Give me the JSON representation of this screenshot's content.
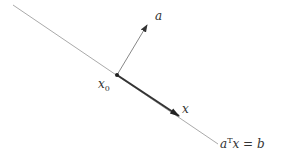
{
  "diagram": {
    "hyperplane": {
      "label_a": "a",
      "label_sup": "T",
      "label_x": "x",
      "label_eq": " = ",
      "label_b": "b"
    },
    "normal_vector": {
      "label": "a"
    },
    "point": {
      "label_base": "x",
      "label_sub": "0"
    },
    "direction_vector": {
      "label": "x"
    },
    "colors": {
      "line": "#aaaaaa",
      "thin_arrow": "#888888",
      "thick_arrow": "#333333",
      "point": "#222222"
    }
  }
}
